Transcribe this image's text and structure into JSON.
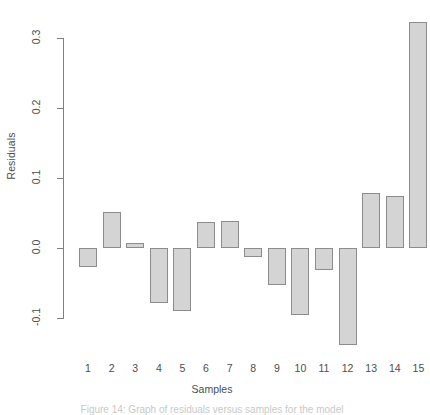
{
  "chart_data": {
    "type": "bar",
    "title": "",
    "xlabel": "Samples",
    "ylabel": "Residuals",
    "categories": [
      "1",
      "2",
      "3",
      "4",
      "5",
      "6",
      "7",
      "8",
      "9",
      "10",
      "11",
      "12",
      "13",
      "14",
      "15"
    ],
    "values": [
      -0.027,
      0.051,
      0.007,
      -0.079,
      -0.09,
      0.037,
      0.039,
      -0.013,
      -0.053,
      -0.096,
      -0.031,
      -0.139,
      0.079,
      0.074,
      0.323
    ],
    "yticks": [
      0.3,
      0.2,
      0.1,
      0.0,
      -0.1
    ],
    "ytick_labels": [
      "0.3",
      "0.2",
      "0.1",
      "0.0",
      "-0.1"
    ],
    "ylim": [
      -0.145,
      0.335
    ],
    "grid": false,
    "legend": null,
    "bar_fill_color": "#d4d4d4",
    "bar_border_color": "#8c8c8c",
    "axis_color": "#808080",
    "text_color": "#4d4d4d",
    "background_color": "#ffffff"
  },
  "caption": {
    "text": "Figure 14: Graph of residuals versus samples for the model"
  }
}
